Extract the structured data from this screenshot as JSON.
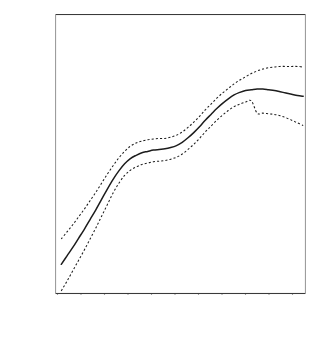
{
  "chart_data": {
    "type": "line",
    "title": "",
    "subtitle": "",
    "xlabel": "Number of Functional Layers of Government in County",
    "ylabel": "Partial Effect of Overlap on Own-Source Revenue",
    "xlim": [
      -0.25,
      10.6
    ],
    "ylim": [
      -215,
      215
    ],
    "grid": false,
    "legend": false,
    "legend_position": "none",
    "xticks": [
      0,
      1,
      2,
      3,
      4,
      5,
      6,
      7,
      8,
      9,
      10
    ],
    "xtick_labels": [
      "0",
      "",
      "2",
      "",
      "4",
      "",
      "6",
      "",
      "8",
      "",
      "10"
    ],
    "yticks": [
      -200,
      -100,
      0,
      100,
      200
    ],
    "ytick_labels": [
      "-200",
      "-100",
      "0",
      "100",
      "200"
    ],
    "x": [
      0,
      0.25,
      0.5,
      0.75,
      1,
      1.25,
      1.5,
      1.75,
      2,
      2.25,
      2.5,
      2.75,
      3,
      3.25,
      3.5,
      3.75,
      4,
      4.25,
      4.5,
      4.75,
      5,
      5.25,
      5.5,
      5.75,
      6,
      6.25,
      6.5,
      6.75,
      7,
      7.25,
      7.5,
      7.75,
      8,
      8.25,
      8.5,
      8.75,
      9,
      9.25,
      9.5,
      9.75,
      10,
      10.25,
      10.5
    ],
    "series": [
      {
        "name": "fit",
        "style": "solid",
        "values": [
          -170,
          -157,
          -144,
          -130,
          -116,
          -101,
          -86,
          -70,
          -54,
          -39,
          -26,
          -15,
          -7,
          -2,
          2,
          4,
          6,
          7,
          8,
          10,
          13,
          18,
          25,
          33,
          42,
          52,
          61,
          70,
          78,
          85,
          91,
          95,
          98,
          99,
          100,
          100,
          99,
          98,
          96,
          94,
          92,
          90,
          89
        ]
      },
      {
        "name": "upper-confidence-band",
        "style": "dashed",
        "values": [
          -131,
          -120,
          -109,
          -97,
          -85,
          -72,
          -59,
          -45,
          -31,
          -18,
          -6,
          4,
          12,
          17,
          20,
          22,
          23,
          24,
          24,
          26,
          29,
          34,
          41,
          49,
          58,
          68,
          77,
          86,
          94,
          101,
          108,
          114,
          119,
          124,
          128,
          131,
          133,
          134,
          135,
          135,
          135,
          135,
          134
        ]
      },
      {
        "name": "lower-confidence-band",
        "style": "dashed",
        "values": [
          -211,
          -196,
          -180,
          -164,
          -148,
          -131,
          -114,
          -96,
          -78,
          -60,
          -45,
          -33,
          -25,
          -20,
          -16,
          -14,
          -12,
          -11,
          -10,
          -8,
          -5,
          0,
          7,
          15,
          24,
          34,
          43,
          52,
          60,
          67,
          73,
          77,
          80,
          82,
          63,
          63,
          62,
          61,
          59,
          56,
          52,
          48,
          44
        ]
      }
    ],
    "note": "Nonparametric partial-effect curve with dashed pointwise confidence bands"
  },
  "axes": {
    "x_title": "Number of Functional Layers of Government in County",
    "y_title": "Partial Effect of Overlap on Own-Source Revenue",
    "x_labels": [
      "0",
      "2",
      "4",
      "6",
      "8",
      "10"
    ],
    "y_labels": [
      "200",
      "100",
      "0",
      "-100",
      "-200"
    ]
  }
}
